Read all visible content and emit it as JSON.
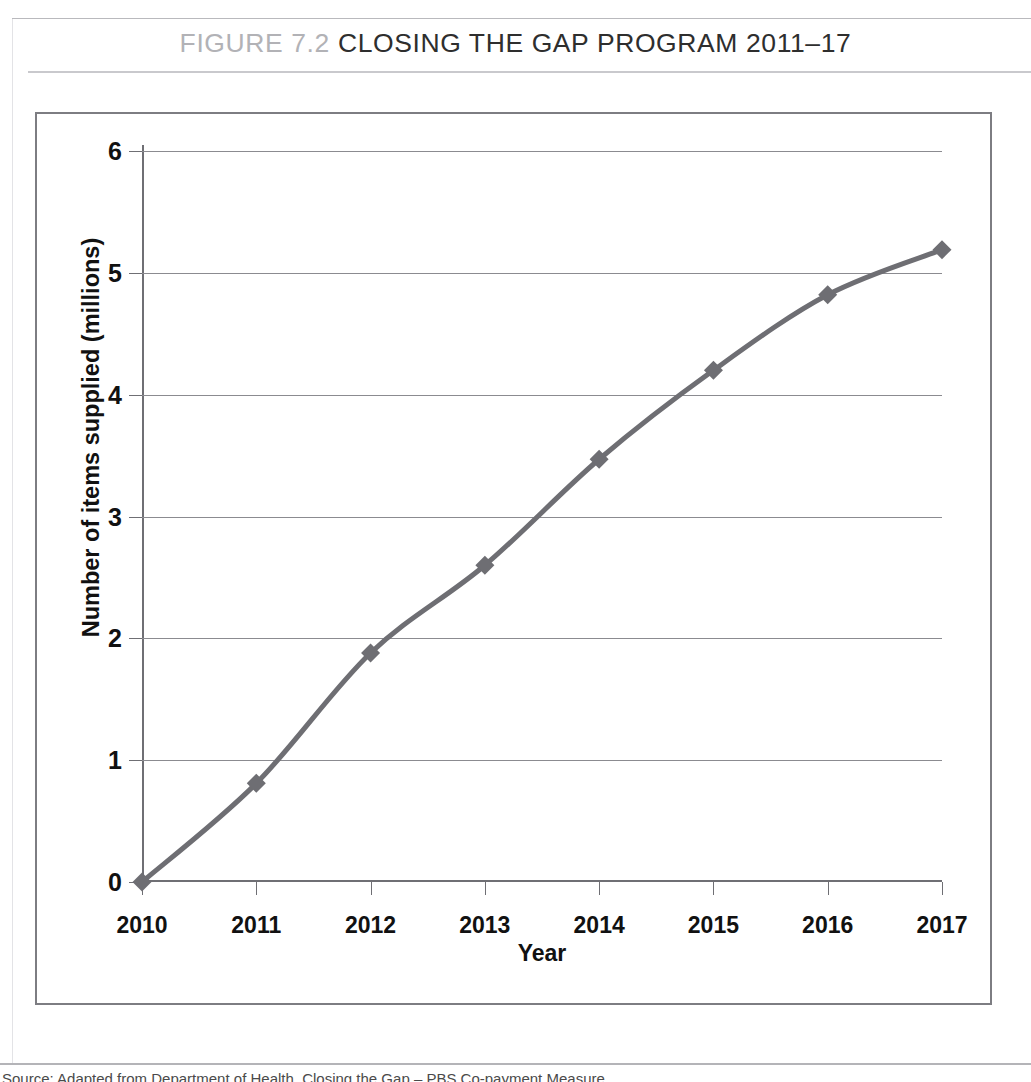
{
  "title": {
    "figure_number": "FIGURE 7.2",
    "figure_name": "CLOSING THE GAP PROGRAM 2011–17"
  },
  "chart_data": {
    "type": "line",
    "title": "CLOSING THE GAP PROGRAM 2011–17",
    "xlabel": "Year",
    "ylabel": "Number of items supplied (millions)",
    "categories": [
      "2010",
      "2011",
      "2012",
      "2013",
      "2014",
      "2015",
      "2016",
      "2017"
    ],
    "values": [
      0,
      0.81,
      1.88,
      2.6,
      3.47,
      4.2,
      4.82,
      5.19
    ],
    "x": [
      2010,
      2011,
      2012,
      2013,
      2014,
      2015,
      2016,
      2017
    ],
    "ylim": [
      0,
      6
    ],
    "xlim": [
      2010,
      2017
    ],
    "ytick_labels": [
      "0",
      "1",
      "2",
      "3",
      "4",
      "5",
      "6"
    ],
    "ytick_values": [
      0,
      1,
      2,
      3,
      4,
      5,
      6
    ],
    "xtick_labels": [
      "2010",
      "2011",
      "2012",
      "2013",
      "2014",
      "2015",
      "2016",
      "2017"
    ],
    "grid": "horizontal",
    "legend": "none",
    "marker": "diamond",
    "series_color": "#6e6e73",
    "grid_color": "#8b8b90",
    "axis_color": "#6f6f74",
    "series": [
      {
        "name": "Number of items supplied (millions)",
        "values": [
          0,
          0.81,
          1.88,
          2.6,
          3.47,
          4.2,
          4.82,
          5.19
        ]
      }
    ]
  },
  "caption": {
    "text": "Source: Adapted from Department of Health, Closing the Gap – PBS Co-payment Measure"
  }
}
